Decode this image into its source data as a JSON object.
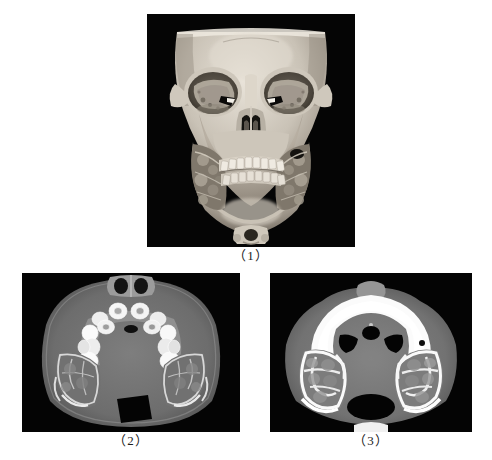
{
  "figure": {
    "background_color": "#ffffff",
    "panel_background": "#000000",
    "caption_color": "#1c1c1c",
    "panels": [
      {
        "id": "panel-1",
        "caption": "（1）",
        "modality": "CT",
        "view": "3D volume-rendered reconstruction",
        "orientation": "frontal / anteroposterior",
        "region": "craniofacial skeleton",
        "description": "Three-dimensional CT reconstruction of the facial skeleton showing markedly expanded maxilla and mandible with multilocular lucent lesions involving both jaws and the orbital floors, producing an upward-turned orbital appearance.",
        "findings": [
          "bilateral symmetric expansion of the mandibular rami and body",
          "multilocular radiolucent lesions within both maxillae",
          "thinned, bulging cortical bone of the jaws",
          "orbital floors elevated, orbits appear enlarged and lesion-filled",
          "irregular dentition with displaced teeth along the alveolar arches",
          "visible upper cervical vertebra inferiorly"
        ],
        "grayscale": {
          "soft_tissue": "#8b8b8b",
          "bone": "#d9d4cc",
          "background": "#050505"
        }
      },
      {
        "id": "panel-2",
        "caption": "（2）",
        "modality": "CT",
        "view": "axial slice",
        "orientation": "axial, through the lower maxillary alveolar process",
        "region": "maxillofacial",
        "description": "Axial CT image at the level of the dental arch demonstrating hyperdense teeth arranged along a U-shaped alveolar ridge with surrounding expansile low-density multilocular lesions in both mandibular rami.",
        "findings": [
          "hyperdense (bright white) teeth along the curved maxillary arch",
          "bilateral expansile multilocular lucent lesions in the posterior jaws",
          "thinned expanded cortical shells around the lesions",
          "central airway lucency in the posterior midline",
          "symmetric soft-tissue envelope of the cheeks"
        ],
        "grayscale": {
          "soft_tissue": "#6e6e6e",
          "bone": "#e8e8e8",
          "air": "#000000"
        }
      },
      {
        "id": "panel-3",
        "caption": "（3）",
        "modality": "CT",
        "view": "axial slice",
        "orientation": "axial, through the hard palate / upper maxilla",
        "region": "maxillofacial",
        "description": "Axial CT image at a more superior level showing the dense arcuate hard palate and maxillary arch with bilateral expansile multilocular lesions containing coarse bony septa within both posterior maxillary/mandibular regions.",
        "findings": [
          "thick hyperdense arc of the maxillary alveolus and hard palate anteriorly",
          "paired air-filled lucencies posterior to the arch",
          "bilateral multilocular expansile lesions with coarse internal septations",
          "posterior midline airway lucency (oropharynx)",
          "symmetric soft-tissue contours"
        ],
        "grayscale": {
          "soft_tissue": "#767676",
          "bone": "#f2f2f2",
          "air": "#000000"
        }
      }
    ]
  }
}
